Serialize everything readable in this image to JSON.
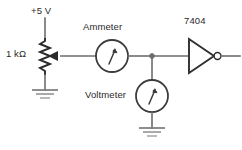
{
  "diagram": {
    "type": "schematic-circuit",
    "background_color": "#ffffff",
    "wire_color": "#6d6d6d",
    "symbol_color": "#2f2f2f",
    "labels": {
      "supply": "+5 V",
      "resistor": "1 kΩ",
      "ammeter": "Ammeter",
      "voltmeter": "Voltmeter",
      "gate": "7404"
    },
    "components": [
      {
        "id": "supply-node",
        "name": "+5 V supply rail",
        "label": "+5 V",
        "symbol": "supply-terminal"
      },
      {
        "id": "potentiometer",
        "name": "1 kilohm potentiometer",
        "label": "1 kΩ",
        "symbol": "zigzag-resistor-with-wiper",
        "value": "1 kΩ"
      },
      {
        "id": "ammeter",
        "name": "Ammeter",
        "label": "Ammeter",
        "symbol": "circle-meter-with-needle",
        "connection": "series"
      },
      {
        "id": "voltmeter",
        "name": "Voltmeter",
        "label": "Voltmeter",
        "symbol": "circle-meter-with-needle",
        "connection": "parallel-to-ground"
      },
      {
        "id": "inverter",
        "name": "7404 hex inverter gate",
        "label": "7404",
        "symbol": "triangle-with-bubble"
      },
      {
        "id": "ground-left",
        "name": "Ground (potentiometer bottom)",
        "label": "",
        "symbol": "earth-ground"
      },
      {
        "id": "ground-bottom",
        "name": "Ground (voltmeter bottom)",
        "label": "",
        "symbol": "earth-ground"
      },
      {
        "id": "junction",
        "name": "Wire junction node",
        "label": "",
        "symbol": "solder-dot"
      }
    ],
    "connections": [
      {
        "from": "supply-node",
        "to": "potentiometer"
      },
      {
        "from": "potentiometer",
        "to": "ground-left"
      },
      {
        "from": "potentiometer",
        "to": "ammeter",
        "via": "wiper"
      },
      {
        "from": "ammeter",
        "to": "junction"
      },
      {
        "from": "junction",
        "to": "voltmeter"
      },
      {
        "from": "voltmeter",
        "to": "ground-bottom"
      },
      {
        "from": "junction",
        "to": "inverter"
      },
      {
        "from": "inverter",
        "to": "output-terminal"
      }
    ]
  }
}
